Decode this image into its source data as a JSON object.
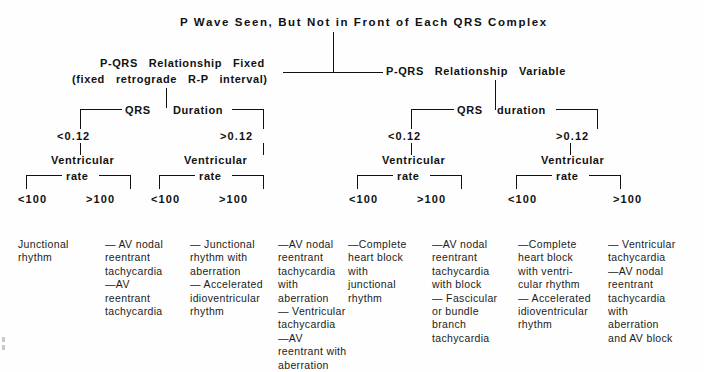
{
  "diagram": {
    "title": "P Wave Seen, But Not in Front of Each QRS Complex",
    "level2": {
      "left_line1": "P-QRS   Relationship   Fixed",
      "left_line2": "(fixed   retrograde   R-P   interval)",
      "right": "P-QRS   Relationship   Variable"
    },
    "level3": {
      "left_qrs": "QRS",
      "left_duration": "Duration",
      "right_qrs": "QRS",
      "right_duration": "duration",
      "left_lt": "<0.12",
      "left_gt": ">0.12",
      "right_lt": "<0.12",
      "right_gt": ">0.12"
    },
    "level4": {
      "rate_label_line1": "Ventricular",
      "rate_label_line2": "rate",
      "groups": [
        {
          "lt": "<100",
          "gt": ">100"
        },
        {
          "lt": "<100",
          "gt": ">100"
        },
        {
          "lt": "<100",
          "gt": ">100"
        },
        {
          "lt": "<100",
          "gt": ">100"
        }
      ]
    },
    "leaves": [
      {
        "id": "leaf-1",
        "text": "Junctional\nrhythm"
      },
      {
        "id": "leaf-2",
        "text": "— AV nodal\nreentrant\ntachycardia\n—AV\nreentrant\ntachycardia"
      },
      {
        "id": "leaf-3",
        "text": "— Junctional\nrhythm with\naberration\n— Accelerated\nidioventricular\nrhythm"
      },
      {
        "id": "leaf-4",
        "text": "—AV nodal\nreentrant\ntachycardia\nwith\naberration\n— Ventricular\ntachycardia\n—AV\nreentrant with\naberration"
      },
      {
        "id": "leaf-5",
        "text": "—Complete\nheart block\nwith\njunctional\nrhythm"
      },
      {
        "id": "leaf-6",
        "text": "—AV nodal\nreentrant\ntachycardia\nwith block\n— Fascicular\nor bundle\nbranch\ntachycardia"
      },
      {
        "id": "leaf-7",
        "text": "—Complete\nheart block\nwith ventri-\ncular rhythm\n— Accelerated\nidioventricular\nrhythm"
      },
      {
        "id": "leaf-8",
        "text": "— Ventricular\ntachycardia\n—AV nodal\nreentrant\ntachycardia\nwith\naberration\nand AV block"
      }
    ]
  }
}
